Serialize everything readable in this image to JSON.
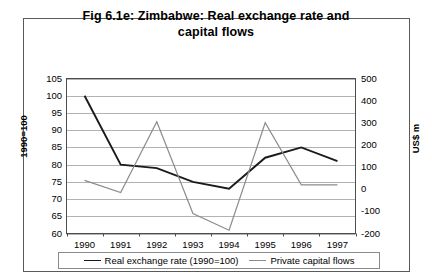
{
  "chart_data": {
    "type": "line",
    "title": "Fig 6.1e: Zimbabwe: Real exchange rate and capital flows",
    "title_line1": "Fig 6.1e: Zimbabwe: Real exchange rate and",
    "title_line2": "capital flows",
    "xlabel": "",
    "ylabel": "1990=100",
    "y2label": "US$ m",
    "categories": [
      "1990",
      "1991",
      "1992",
      "1993",
      "1994",
      "1995",
      "1996",
      "1997"
    ],
    "x": [
      1990,
      1991,
      1992,
      1993,
      1994,
      1995,
      1996,
      1997
    ],
    "ylim": [
      60,
      105
    ],
    "y2lim": [
      -200,
      500
    ],
    "yticks": [
      105,
      100,
      95,
      90,
      85,
      80,
      75,
      70,
      65,
      60
    ],
    "y2ticks": [
      500,
      400,
      300,
      200,
      100,
      0,
      -100,
      -200
    ],
    "grid": true,
    "legend_position": "bottom",
    "series": [
      {
        "name": "Real exchange rate (1990=100)",
        "axis": "left",
        "color": "#1a1a1a",
        "values": [
          100,
          80,
          79,
          75,
          73,
          82,
          85,
          81
        ]
      },
      {
        "name": "Private capital flows",
        "axis": "right",
        "color": "#8c8c8c",
        "values": [
          40,
          -15,
          305,
          -110,
          -185,
          300,
          20,
          20
        ]
      }
    ]
  },
  "legend": {
    "entries": [
      {
        "label": "Real exchange rate (1990=100)",
        "swatch": "dark"
      },
      {
        "label": "Private capital flows",
        "swatch": "gray"
      }
    ]
  }
}
